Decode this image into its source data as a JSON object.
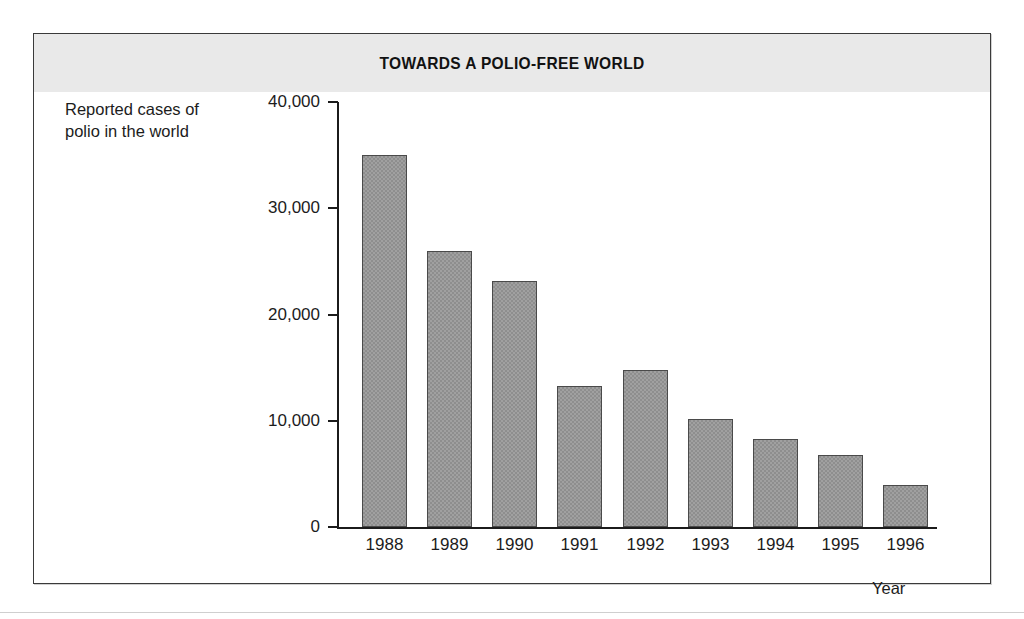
{
  "figure": {
    "title": "TOWARDS A POLIO-FREE WORLD",
    "y_caption": "Reported cases of\npolio in the world",
    "x_caption": "Year",
    "frame_border_color": "#3a3a3a",
    "title_band_color": "#e9e9e9",
    "bar_color": "#8e8e8e",
    "axis_color": "#1b1b1b"
  },
  "chart_data": {
    "type": "bar",
    "title": "TOWARDS A POLIO-FREE WORLD",
    "xlabel": "Year",
    "ylabel": "Reported cases of polio in the world",
    "categories": [
      "1988",
      "1989",
      "1990",
      "1991",
      "1992",
      "1993",
      "1994",
      "1995",
      "1996"
    ],
    "values": [
      35000,
      26000,
      23200,
      13300,
      14800,
      10200,
      8300,
      6800,
      4000
    ],
    "ylim": [
      0,
      40000
    ],
    "ytick_values": [
      0,
      10000,
      20000,
      30000,
      40000
    ],
    "ytick_labels": [
      "0",
      "10,000",
      "20,000",
      "30,000",
      "40,000"
    ],
    "grid": false,
    "legend": "none",
    "series_name": "Reported cases of polio in the world"
  }
}
